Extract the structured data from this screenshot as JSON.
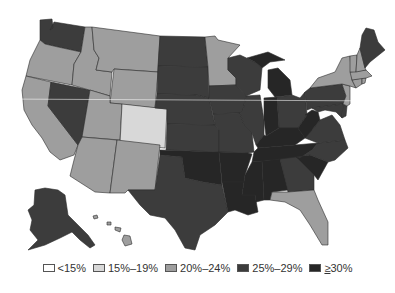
{
  "colors": {
    "lt15": "#ffffff",
    "c15_19": "#d8d8d8",
    "c20_24": "#9e9e9e",
    "c25_29": "#3c3c3c",
    "ge30": "#262626",
    "border": "#2b2b2b",
    "background": "#ffffff"
  },
  "legend": {
    "items": [
      {
        "key": "lt15",
        "label": "<15%"
      },
      {
        "key": "c15_19",
        "label": "15%–19%"
      },
      {
        "key": "c20_24",
        "label": "20%–24%"
      },
      {
        "key": "c25_29",
        "label": "25%–29%"
      },
      {
        "key": "ge30",
        "prefix": "≥",
        "label": "30%"
      }
    ]
  },
  "states": {
    "WA": "c25_29",
    "OR": "c20_24",
    "CA": "c20_24",
    "NV": "c25_29",
    "ID": "c20_24",
    "MT": "c20_24",
    "WY": "c20_24",
    "UT": "c20_24",
    "AZ": "c20_24",
    "CO": "c15_19",
    "NM": "c20_24",
    "ND": "c25_29",
    "SD": "c25_29",
    "NE": "c25_29",
    "KS": "c25_29",
    "OK": "ge30",
    "TX": "c25_29",
    "MN": "c20_24",
    "IA": "c25_29",
    "MO": "c25_29",
    "AR": "ge30",
    "LA": "ge30",
    "WI": "c25_29",
    "IL": "c25_29",
    "MI": "ge30",
    "IN": "ge30",
    "OH": "c25_29",
    "KY": "ge30",
    "TN": "ge30",
    "MS": "ge30",
    "AL": "ge30",
    "GA": "c25_29",
    "FL": "c20_24",
    "SC": "ge30",
    "NC": "c25_29",
    "VA": "c25_29",
    "WV": "ge30",
    "PA": "c25_29",
    "NY": "c20_24",
    "VT": "c20_24",
    "NH": "c20_24",
    "ME": "c25_29",
    "MA": "c20_24",
    "CT": "c20_24",
    "RI": "c20_24",
    "NJ": "c20_24",
    "DE": "c25_29",
    "MD": "c25_29",
    "AK": "c25_29",
    "HI": "c20_24"
  }
}
